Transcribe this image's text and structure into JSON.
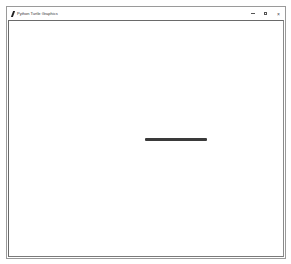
{
  "window": {
    "title": "Python Turtle Graphics",
    "app_icon": "feather-icon",
    "controls": {
      "minimize": "–",
      "maximize": "□",
      "close": "×"
    }
  },
  "canvas": {
    "background": "#ffffff",
    "drawing": {
      "type": "line",
      "color": "#3a3a3a",
      "x1": 145,
      "y1": 139,
      "x2": 207,
      "y2": 139,
      "width_px": 3
    }
  }
}
